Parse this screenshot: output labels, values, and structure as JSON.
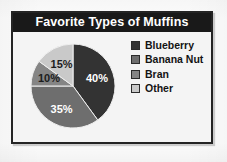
{
  "chart": {
    "title": "Favorite Types of Muffins",
    "title_bar_color": "#191919",
    "title_text_color": "#ffffff",
    "frame_border_color": "#242424",
    "background_color": "#f4f4f4"
  },
  "chart_data": {
    "type": "pie",
    "title": "Favorite Types of Muffins",
    "xlabel": "",
    "ylabel": "",
    "legend_position": "right",
    "grid": false,
    "start_angle_deg": 0,
    "direction": "clockwise",
    "categories": [
      "Blueberry",
      "Banana Nut",
      "Bran",
      "Other"
    ],
    "values": [
      40,
      35,
      10,
      15
    ],
    "value_unit": "%",
    "data_labels": [
      "40%",
      "35%",
      "10%",
      "15%"
    ],
    "colors": [
      "#333333",
      "#6e6e6e",
      "#858585",
      "#c9c9c9"
    ],
    "label_text_colors": [
      "#ffffff",
      "#ffffff",
      "#1c1c1c",
      "#1c1c1c"
    ]
  },
  "legend": {
    "items": [
      {
        "label": "Blueberry",
        "color": "#333333"
      },
      {
        "label": "Banana Nut",
        "color": "#6e6e6e"
      },
      {
        "label": "Bran",
        "color": "#858585"
      },
      {
        "label": "Other",
        "color": "#c9c9c9"
      }
    ]
  }
}
